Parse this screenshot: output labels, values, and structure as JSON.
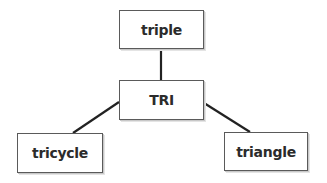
{
  "diagram": {
    "type": "tree",
    "root": {
      "id": "tri",
      "label": "TRI"
    },
    "nodes": [
      {
        "id": "triple",
        "label": "triple"
      },
      {
        "id": "tri",
        "label": "TRI"
      },
      {
        "id": "tricycle",
        "label": "tricycle"
      },
      {
        "id": "triangle",
        "label": "triangle"
      }
    ],
    "edges": [
      {
        "from": "tri",
        "to": "triple"
      },
      {
        "from": "tri",
        "to": "tricycle"
      },
      {
        "from": "tri",
        "to": "triangle"
      }
    ],
    "colors": {
      "line": "#222222",
      "border": "#5a5a5a",
      "text": "#2b2b2b",
      "background": "#ffffff"
    }
  }
}
